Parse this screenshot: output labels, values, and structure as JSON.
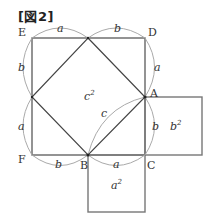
{
  "figure": {
    "title": "[図2]",
    "points": {
      "E": "E",
      "D": "D",
      "A": "A",
      "F": "F",
      "B": "B",
      "C": "C"
    },
    "side_labels": {
      "top_left": "a",
      "top_right": "b",
      "right_upper": "a",
      "right_lower": "b",
      "left_upper": "b",
      "left_lower": "a",
      "bottom_left": "b",
      "bottom_right": "a",
      "hypotenuse": "c"
    },
    "area_labels": {
      "inner_square": "c",
      "inner_exp": "2",
      "right_square": "b",
      "right_exp": "2",
      "bottom_square": "a",
      "bottom_exp": "2"
    },
    "colors": {
      "line": "#555555",
      "arc": "#999999",
      "text": "#333333"
    }
  }
}
